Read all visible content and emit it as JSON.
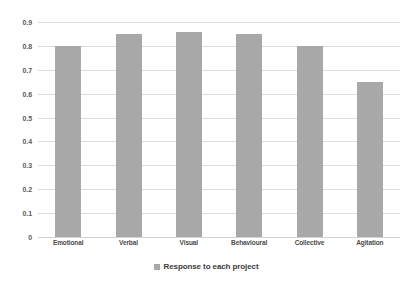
{
  "chart_data": {
    "type": "bar",
    "title": "",
    "subtitle": "",
    "xlabel": "",
    "ylabel": "",
    "categories": [
      "Emotional",
      "Verbal",
      "Visual",
      "Behavioural",
      "Collective",
      "Agitation"
    ],
    "values": [
      0.8,
      0.85,
      0.86,
      0.85,
      0.8,
      0.65
    ],
    "series": [
      {
        "name": "Response to each project",
        "values": [
          0.8,
          0.85,
          0.86,
          0.85,
          0.8,
          0.65
        ]
      }
    ],
    "ylim": [
      0,
      0.9
    ],
    "ytick_labels": [
      "0.9",
      "0.8",
      "0.7",
      "0.6",
      "0.5",
      "0.4",
      "0.3",
      "0.2",
      "0.1",
      "0"
    ],
    "ytick_values": [
      0.9,
      0.8,
      0.7,
      0.6,
      0.5,
      0.4,
      0.3,
      0.2,
      0.1,
      0
    ],
    "grid": true,
    "grid_axis": "y",
    "legend": {
      "position": "bottom",
      "entries": [
        {
          "label": "Response to each project",
          "color": "#a8a8a8",
          "marker": "square"
        }
      ]
    },
    "colors": {
      "bar_fill": "#a8a8a8",
      "gridline": "#dcdcdc",
      "background": "#ffffff",
      "tick_text": "#5a5a5a",
      "legend_text": "#3c3c3c"
    }
  }
}
